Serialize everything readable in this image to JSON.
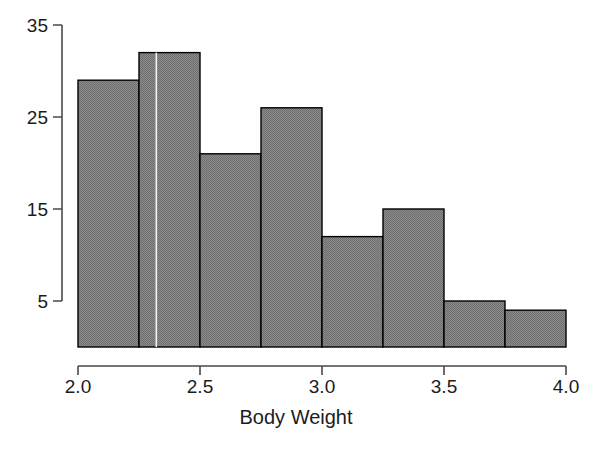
{
  "chart_data": {
    "type": "bar",
    "subtype": "histogram",
    "title": "",
    "xlabel": "Body Weight",
    "ylabel": "",
    "xlim": [
      2.0,
      4.0
    ],
    "ylim": [
      0,
      36
    ],
    "bin_width": 0.25,
    "bin_edges": [
      2.0,
      2.25,
      2.5,
      2.75,
      3.0,
      3.25,
      3.5,
      3.75,
      4.0
    ],
    "categories": [
      "2.00-2.25",
      "2.25-2.50",
      "2.50-2.75",
      "2.75-3.00",
      "3.00-3.25",
      "3.25-3.50",
      "3.50-3.75",
      "3.75-4.00"
    ],
    "values": [
      29,
      32,
      21,
      26,
      12,
      15,
      5,
      4
    ],
    "x_ticks": [
      {
        "value": 2.0,
        "label": "2.0"
      },
      {
        "value": 2.5,
        "label": "2.5"
      },
      {
        "value": 3.0,
        "label": "3.0"
      },
      {
        "value": 3.5,
        "label": "3.5"
      },
      {
        "value": 4.0,
        "label": "4.0"
      }
    ],
    "y_ticks": [
      {
        "value": 5,
        "label": "5"
      },
      {
        "value": 15,
        "label": "15"
      },
      {
        "value": 25,
        "label": "25"
      },
      {
        "value": 35,
        "label": "35"
      }
    ],
    "grid": false,
    "legend": null,
    "bar_fill_color": "#848484",
    "bar_border_color": "#000000",
    "axis_color": "#4a4a4a",
    "background_color": "#ffffff"
  }
}
